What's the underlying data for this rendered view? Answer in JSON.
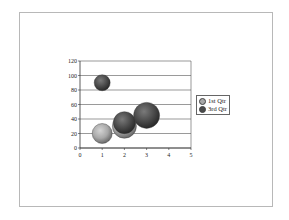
{
  "chart_data": {
    "type": "bubble",
    "title": "",
    "xlabel": "",
    "ylabel": "",
    "xlim": [
      0,
      5
    ],
    "ylim": [
      0,
      120
    ],
    "x_ticks": [
      "0",
      "1",
      "2",
      "3",
      "4",
      "5"
    ],
    "y_ticks": [
      "0",
      "20",
      "40",
      "60",
      "80",
      "100",
      "120"
    ],
    "grid": "horizontal",
    "legend_position": "right",
    "series": [
      {
        "name": "1st Qtr",
        "color": "#a8a8a8",
        "points": [
          {
            "x": 1,
            "y": 20,
            "size": 10
          },
          {
            "x": 2,
            "y": 30,
            "size": 12
          }
        ]
      },
      {
        "name": "3rd Qtr",
        "color": "#4a4a4a",
        "points": [
          {
            "x": 1,
            "y": 90,
            "size": 8
          },
          {
            "x": 2,
            "y": 35,
            "size": 11
          },
          {
            "x": 3,
            "y": 45,
            "size": 13
          }
        ]
      }
    ]
  },
  "legend": {
    "items": [
      {
        "label": "1st Qtr",
        "color": "#a8a8a8"
      },
      {
        "label": "3rd Qtr",
        "color": "#4a4a4a"
      }
    ]
  }
}
